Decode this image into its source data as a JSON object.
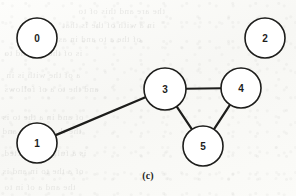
{
  "figure": {
    "caption": "(c)",
    "width": 296,
    "height": 196,
    "background_color": "#fbfbf9",
    "ink_color": "#1d1d1b",
    "node_fill_color": "#ffffff"
  },
  "ghost_text": {
    "note": "faint bleed-through text from the reverse side of the scanned page (illegible)",
    "lines": [
      {
        "text": "the  are  and  this  of  to",
        "x": 78,
        "y": 6,
        "size": 9
      },
      {
        "text": "in  a  with  of  the  is  that",
        "x": 62,
        "y": 20,
        "size": 9
      },
      {
        "text": "of  the  a  to  and  in  as",
        "x": 58,
        "y": 34,
        "size": 9
      },
      {
        "text": "is  of  the  for  and  to",
        "x": 4,
        "y": 48,
        "size": 9
      },
      {
        "text": "a  of  the  with  is  in",
        "x": 6,
        "y": 70,
        "size": 9
      },
      {
        "text": "and  the  to  a  of  follows",
        "x": 4,
        "y": 84,
        "size": 9
      },
      {
        "text": "of  and  in  a  the  to  is",
        "x": 2,
        "y": 112,
        "size": 9
      },
      {
        "text": "the  that  a  of  in  and",
        "x": 2,
        "y": 126,
        "size": 9
      },
      {
        "text": "is  a  fully  connected",
        "x": 4,
        "y": 148,
        "size": 9
      },
      {
        "text": "of  a  the  to  in  and  is",
        "x": 2,
        "y": 166,
        "size": 9
      },
      {
        "text": "the  and  a  of  in  to",
        "x": 4,
        "y": 182,
        "size": 9
      }
    ]
  },
  "chart_data": {
    "type": "diagram",
    "diagram_kind": "undirected-graph",
    "title": "(c)",
    "nodes": [
      {
        "id": "0",
        "label": "0",
        "cx": 37,
        "cy": 38,
        "r": 20
      },
      {
        "id": "1",
        "label": "1",
        "cx": 37,
        "cy": 143,
        "r": 20
      },
      {
        "id": "2",
        "label": "2",
        "cx": 265,
        "cy": 38,
        "r": 20
      },
      {
        "id": "3",
        "label": "3",
        "cx": 165,
        "cy": 89,
        "r": 21
      },
      {
        "id": "4",
        "label": "4",
        "cx": 241,
        "cy": 88,
        "r": 20
      },
      {
        "id": "5",
        "label": "5",
        "cx": 203,
        "cy": 146,
        "r": 20
      }
    ],
    "edges": [
      {
        "source": "1",
        "target": "3"
      },
      {
        "source": "3",
        "target": "4"
      },
      {
        "source": "3",
        "target": "5"
      },
      {
        "source": "4",
        "target": "5"
      }
    ],
    "isolated_nodes": [
      "0",
      "2"
    ],
    "node_count": 6,
    "edge_count": 4,
    "edge_stroke_width": 2.2,
    "node_stroke_width": 1.6
  }
}
